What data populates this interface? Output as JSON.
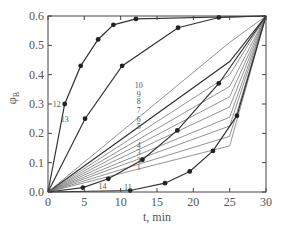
{
  "chart_data": {
    "type": "line",
    "title": "",
    "xlabel": "t, min",
    "ylabel": "φB",
    "xlim": [
      0,
      30
    ],
    "ylim": [
      0,
      0.6
    ],
    "xticks": [
      0,
      5,
      10,
      15,
      20,
      25,
      30
    ],
    "xtick_labels": [
      "0",
      "5",
      "10",
      "15",
      "20",
      "25",
      "30"
    ],
    "yticks": [
      0.0,
      0.1,
      0.2,
      0.3,
      0.4,
      0.5,
      0.6
    ],
    "ytick_labels": [
      "0.0",
      "0.1",
      "0.2",
      "0.3",
      "0.4",
      "0.5",
      "0.6"
    ],
    "grid": false,
    "legend": "none (curves labeled inline by number)",
    "series": [
      {
        "name": "1",
        "markers": false,
        "x": [
          0,
          25,
          30
        ],
        "y": [
          0,
          0.157,
          0.6
        ],
        "label_pos": [
          12.5,
          0.085
        ]
      },
      {
        "name": "2",
        "markers": false,
        "x": [
          0,
          25,
          30
        ],
        "y": [
          0,
          0.19,
          0.6
        ],
        "label_pos": [
          12.5,
          0.11
        ]
      },
      {
        "name": "3",
        "markers": false,
        "x": [
          0,
          25,
          30
        ],
        "y": [
          0,
          0.225,
          0.6
        ],
        "label_pos": [
          12.5,
          0.135
        ]
      },
      {
        "name": "4",
        "markers": false,
        "x": [
          0,
          25,
          30
        ],
        "y": [
          0,
          0.255,
          0.6
        ],
        "label_pos": [
          12.5,
          0.16
        ]
      },
      {
        "name": "5",
        "markers": false,
        "x": [
          0,
          25,
          30
        ],
        "y": [
          0,
          0.29,
          0.6
        ],
        "label_pos": [
          12.5,
          0.225
        ]
      },
      {
        "name": "6",
        "markers": false,
        "x": [
          0,
          25,
          30
        ],
        "y": [
          0,
          0.325,
          0.6
        ],
        "label_pos": [
          12.5,
          0.25
        ]
      },
      {
        "name": "7",
        "markers": false,
        "x": [
          0,
          25,
          30
        ],
        "y": [
          0,
          0.36,
          0.6
        ],
        "label_pos": [
          12.5,
          0.28
        ]
      },
      {
        "name": "8",
        "markers": false,
        "x": [
          0,
          25,
          30
        ],
        "y": [
          0,
          0.4,
          0.6
        ],
        "label_pos": [
          12.5,
          0.31
        ]
      },
      {
        "name": "9",
        "markers": false,
        "x": [
          0,
          25,
          30
        ],
        "y": [
          0,
          0.445,
          0.6
        ],
        "label_pos": [
          12.5,
          0.335
        ]
      },
      {
        "name": "10",
        "markers": false,
        "x": [
          0,
          25,
          30
        ],
        "y": [
          0,
          0.51,
          0.6
        ],
        "label_pos": [
          12.5,
          0.365
        ]
      },
      {
        "name": "11",
        "markers": true,
        "x": [
          0,
          11.3,
          16.1,
          19.5,
          22.7,
          26.0,
          30
        ],
        "y": [
          0,
          0.005,
          0.03,
          0.07,
          0.14,
          0.26,
          0.6
        ],
        "label_pos": [
          11.0,
          0.018
        ]
      },
      {
        "name": "12",
        "markers": true,
        "x": [
          0,
          2.3,
          4.5,
          6.9,
          9.0,
          12.1,
          30
        ],
        "y": [
          0,
          0.3,
          0.43,
          0.52,
          0.57,
          0.59,
          0.6
        ],
        "label_pos": [
          1.2,
          0.3
        ]
      },
      {
        "name": "13",
        "markers": true,
        "x": [
          0,
          5.1,
          10.2,
          17.9,
          23.5,
          30
        ],
        "y": [
          0,
          0.25,
          0.43,
          0.56,
          0.595,
          0.6
        ],
        "label_pos": [
          2.3,
          0.25
        ]
      },
      {
        "name": "14",
        "markers": true,
        "x": [
          0,
          4.8,
          8.3,
          13.0,
          17.8,
          23.5,
          30
        ],
        "y": [
          0,
          0.015,
          0.045,
          0.11,
          0.21,
          0.37,
          0.6
        ],
        "label_pos": [
          7.5,
          0.022
        ]
      }
    ]
  }
}
